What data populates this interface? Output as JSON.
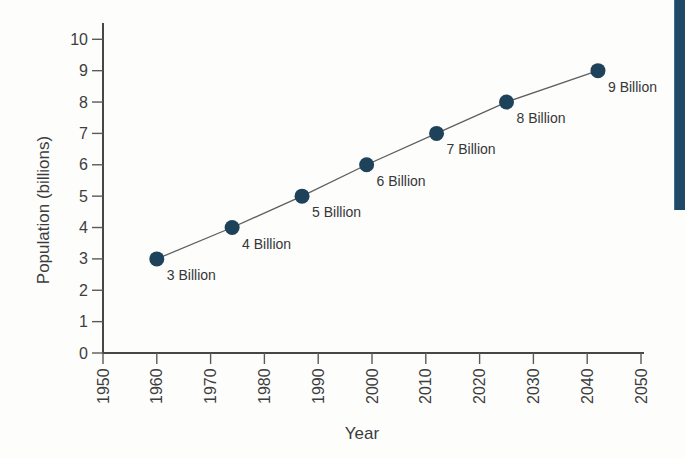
{
  "page_strip": {
    "color": "#214864",
    "edge_color": "#3f6f93"
  },
  "chart_data": {
    "type": "line",
    "xlabel": "Year",
    "ylabel": "Population (billions)",
    "x": [
      1960,
      1974,
      1987,
      1999,
      2012,
      2025,
      2042
    ],
    "values": [
      3,
      4,
      5,
      6,
      7,
      8,
      9
    ],
    "point_labels": [
      "3 Billion",
      "4 Billion",
      "5 Billion",
      "6 Billion",
      "7 Billion",
      "8 Billion",
      "9 Billion"
    ],
    "x_ticks": [
      1950,
      1960,
      1970,
      1980,
      1990,
      2000,
      2010,
      2020,
      2030,
      2040,
      2050
    ],
    "y_ticks": [
      0,
      1,
      2,
      3,
      4,
      5,
      6,
      7,
      8,
      9,
      10
    ],
    "xlim": [
      1950,
      2050
    ],
    "ylim": [
      0,
      10
    ],
    "grid": false,
    "legend": false,
    "colors": {
      "point": "#1e4259",
      "line": "#5f5f5f",
      "axis": "#474747",
      "tick": "#5a5a5a",
      "tick_text": "#3e3e3e",
      "label_text": "#373737"
    }
  }
}
